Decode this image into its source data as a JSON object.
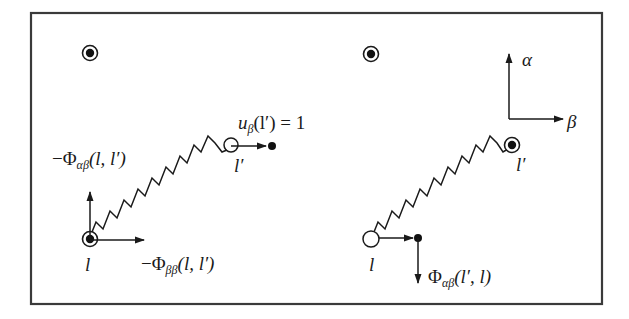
{
  "figure": {
    "frame": {
      "x": 31,
      "y": 13,
      "width": 571,
      "height": 291,
      "stroke": "#3a3a3a"
    },
    "left_panel": {
      "labels": {
        "displacement": "u",
        "displacement_sub": "β",
        "displacement_arg": "(l′) = 1",
        "force_alpha_beta_prefix": "−Φ",
        "force_alpha_beta_sub": "αβ",
        "force_alpha_beta_arg": "(l, l′)",
        "force_beta_beta_prefix": "−Φ",
        "force_beta_beta_sub": "ββ",
        "force_beta_beta_arg": "(l, l′)",
        "atom_l": "l",
        "atom_l_prime": "l′"
      },
      "atoms": [
        {
          "name": "reference-atom-top",
          "type": "filled-ring",
          "cx": 90,
          "cy": 53
        },
        {
          "name": "atom-l",
          "type": "filled-ring",
          "cx": 90,
          "cy": 239
        },
        {
          "name": "atom-l-prime-original",
          "type": "open",
          "cx": 231,
          "cy": 145
        },
        {
          "name": "atom-l-prime-displaced",
          "type": "dot",
          "cx": 272,
          "cy": 146
        }
      ]
    },
    "right_panel": {
      "labels": {
        "force_prefix": "Φ",
        "force_sub": "αβ",
        "force_arg": "(l′, l)",
        "atom_l": "l",
        "atom_l_prime": "l′",
        "axis_alpha": "α",
        "axis_beta": "β"
      },
      "atoms": [
        {
          "name": "reference-atom-top",
          "type": "filled-ring",
          "cx": 371,
          "cy": 54
        },
        {
          "name": "atom-l-prime",
          "type": "filled-ring",
          "cx": 512,
          "cy": 145
        },
        {
          "name": "atom-l-original",
          "type": "open",
          "cx": 371,
          "cy": 239
        },
        {
          "name": "atom-l-displaced",
          "type": "dot",
          "cx": 418,
          "cy": 238
        }
      ]
    }
  }
}
